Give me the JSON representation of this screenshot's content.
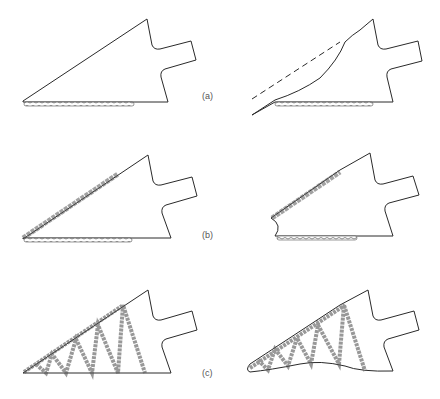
{
  "figure": {
    "panels": [
      {
        "id": "a",
        "label": "(a)",
        "description": "Weld along bottom edge only; right view shows distortion of upper edge vs original (dashed)"
      },
      {
        "id": "b",
        "label": "(b)",
        "description": "Welds along bottom and sloping edges; right view shows distortion at nose"
      },
      {
        "id": "c",
        "label": "(c)",
        "description": "Lattice of diagonal stiffener welds; right view shows bowed bottom edge"
      }
    ],
    "line_color": "#2a2a2a",
    "weld_color": "#555555"
  }
}
